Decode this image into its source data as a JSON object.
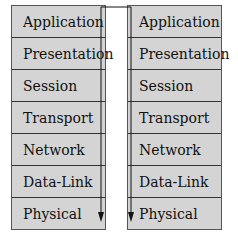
{
  "diagram": {
    "left_stack": {
      "layers": [
        "Application",
        "Presentation",
        "Session",
        "Transport",
        "Network",
        "Data-Link",
        "Physical"
      ]
    },
    "right_stack": {
      "layers": [
        "Application",
        "Presentation",
        "Session",
        "Transport",
        "Network",
        "Data-Link",
        "Physical"
      ]
    },
    "connector": {
      "description": "Line runs from top of left stack across to right stack, down-arrows along right edge of left stack and left edge of right stack",
      "color": "#111111"
    },
    "colors": {
      "layer_fill": "#d4d4d4",
      "border": "#333333",
      "background": "#ffffff"
    }
  }
}
